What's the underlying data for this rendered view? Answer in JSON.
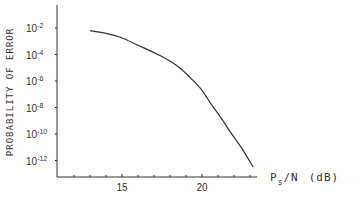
{
  "chart_data": {
    "type": "line",
    "title": "",
    "xlabel": "P_s/N (dB)",
    "xlabel_main": "P",
    "xlabel_sub": "s",
    "xlabel_rest": "/N",
    "xlabel_unit": "(dB)",
    "ylabel": "PROBABILITY OF ERROR",
    "yscale": "log",
    "xlim": [
      11.5,
      24.5
    ],
    "ylim_exp": [
      -13.2,
      0
    ],
    "x_ticks": [
      12,
      13,
      14,
      15,
      16,
      17,
      18,
      19,
      20,
      21,
      22,
      23,
      24
    ],
    "x_tick_labels": [
      {
        "value": 15,
        "label": "15"
      },
      {
        "value": 20,
        "label": "20"
      }
    ],
    "y_tick_labels": [
      {
        "exp": -2,
        "base": "10",
        "sup": "-2"
      },
      {
        "exp": -4,
        "base": "10",
        "sup": "-4"
      },
      {
        "exp": -6,
        "base": "10",
        "sup": "-6"
      },
      {
        "exp": -8,
        "base": "10",
        "sup": "-8"
      },
      {
        "exp": -10,
        "base": "10",
        "sup": "-10"
      },
      {
        "exp": -12,
        "base": "10",
        "sup": "-12"
      }
    ],
    "grid": false,
    "series": [
      {
        "name": "probability of error",
        "x": [
          13.0,
          14.0,
          14.9,
          16.0,
          17.4,
          18.5,
          19.3,
          20.0,
          20.6,
          21.2,
          21.8,
          22.5,
          23.2
        ],
        "log10_y": [
          -2.2,
          -2.4,
          -2.7,
          -3.3,
          -4.1,
          -4.9,
          -5.8,
          -6.7,
          -7.8,
          -8.8,
          -9.9,
          -11.1,
          -12.5
        ]
      }
    ]
  }
}
